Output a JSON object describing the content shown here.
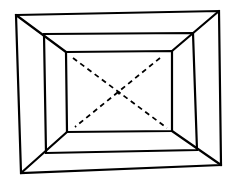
{
  "diagram": {
    "type": "line-drawing",
    "stroke_color": "#000000",
    "background_color": "#ffffff",
    "outer_frame": [
      [
        16,
        15
      ],
      [
        219,
        11
      ],
      [
        221,
        165
      ],
      [
        21,
        173
      ]
    ],
    "middle_frame": [
      [
        44,
        34
      ],
      [
        193,
        33
      ],
      [
        197,
        150
      ],
      [
        46,
        153
      ]
    ],
    "inner_frame": [
      [
        66,
        52
      ],
      [
        172,
        51
      ],
      [
        172,
        131
      ],
      [
        67,
        132
      ]
    ],
    "corner_edges": [
      [
        [
          16,
          15
        ],
        [
          66,
          52
        ]
      ],
      [
        [
          219,
          11
        ],
        [
          172,
          51
        ]
      ],
      [
        [
          221,
          165
        ],
        [
          172,
          131
        ]
      ],
      [
        [
          21,
          173
        ],
        [
          67,
          132
        ]
      ]
    ],
    "dashed_diagonals": [
      [
        [
          73,
          58
        ],
        [
          167,
          128
        ]
      ],
      [
        [
          160,
          58
        ],
        [
          75,
          127
        ]
      ]
    ],
    "center_point": [
      119,
      93
    ]
  }
}
